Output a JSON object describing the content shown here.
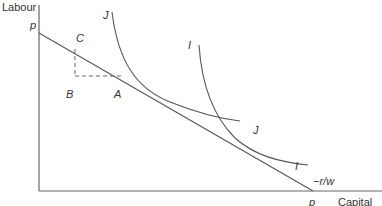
{
  "diagram": {
    "type": "isoquant-isocost diagram",
    "axes": {
      "y_label": "Labour",
      "x_label": "Capital"
    },
    "budget_line": {
      "y_intercept_label": "p",
      "x_intercept_label": "p",
      "slope_label": "−r/w"
    },
    "curves": [
      {
        "name": "J",
        "top_label": "J",
        "bottom_label": "J"
      },
      {
        "name": "I",
        "top_label": "I",
        "bottom_label": "I"
      }
    ],
    "points": {
      "C": "C",
      "B": "B",
      "A": "A"
    },
    "colors": {
      "line": "#555555",
      "axis": "#666666",
      "dash": "#666666",
      "text": "#333333"
    }
  }
}
